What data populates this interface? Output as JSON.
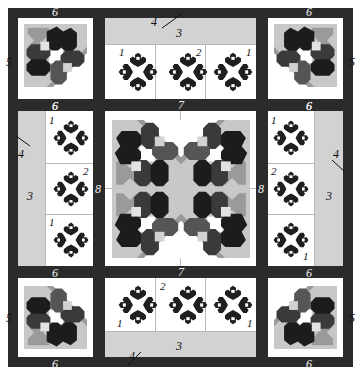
{
  "diagram": {
    "type": "quilt-block-layout",
    "width": 361,
    "height": 375,
    "palette": {
      "frame_dark": "#2b2b2b",
      "sashing_dark": "#2b2b2b",
      "background_white": "#ffffff",
      "border_gray": "#d2d2d2",
      "petal_darkest": "#1c1c1c",
      "petal_dark": "#3a3a3a",
      "petal_mid": "#555555",
      "accent_gray": "#9a9a9a",
      "light_gray": "#c8c8c8",
      "hairline": "#b9b9b9"
    }
  },
  "labels": {
    "block_1": "1",
    "block_2": "2",
    "border_3": "3",
    "leader_4": "4",
    "corner_5": "5",
    "corner_6": "6",
    "sashing_7": "7",
    "sashing_8": "8"
  },
  "corners": [
    {
      "name": "top-left",
      "top_label": "6",
      "side_label": "5",
      "bottom_label": "6"
    },
    {
      "name": "top-right",
      "top_label": "6",
      "side_label": "5",
      "bottom_label": "6"
    },
    {
      "name": "bottom-left",
      "top_label": "6",
      "side_label": "5",
      "bottom_label": "6"
    },
    {
      "name": "bottom-right",
      "top_label": "6",
      "side_label": "5",
      "bottom_label": "6"
    }
  ],
  "edge_panels": {
    "top": {
      "border_label": "3",
      "leader_label": "4",
      "sashing_label": "7",
      "block_labels": [
        "1",
        "2",
        "1"
      ]
    },
    "bottom": {
      "border_label": "3",
      "leader_label": "4",
      "sashing_label": "7",
      "block_labels": [
        "1",
        "2",
        "1"
      ]
    },
    "left": {
      "border_label": "3",
      "leader_label": "4",
      "sashing_label": "8",
      "top_label": "6",
      "bottom_label": "6",
      "block_labels": [
        "1",
        "2",
        "1"
      ]
    },
    "right": {
      "border_label": "3",
      "leader_label": "4",
      "sashing_label": "8",
      "top_label": "6",
      "bottom_label": "6",
      "block_labels": [
        "1",
        "2",
        "1"
      ]
    }
  },
  "center": {
    "name": "center-medallion",
    "quadrants": 4,
    "motif": "four-way-mirrored-floral"
  }
}
